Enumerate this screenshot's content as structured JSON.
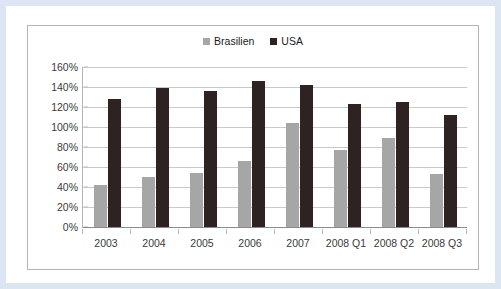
{
  "chart_data": {
    "type": "bar",
    "title": "",
    "xlabel": "",
    "ylabel": "",
    "categories": [
      "2003",
      "2004",
      "2005",
      "2006",
      "2007",
      "2008 Q1",
      "2008 Q2",
      "2008 Q3"
    ],
    "series": [
      {
        "name": "Brasilien",
        "color": "#a6a6a6",
        "values": [
          42,
          50,
          54,
          66,
          104,
          77,
          89,
          53
        ]
      },
      {
        "name": "USA",
        "color": "#2e2222",
        "values": [
          128,
          139,
          136,
          146,
          142,
          123,
          125,
          112
        ]
      }
    ],
    "ylim": [
      0,
      160
    ],
    "ytick_step": 20,
    "ytick_labels": [
      "0%",
      "20%",
      "40%",
      "60%",
      "80%",
      "100%",
      "120%",
      "140%",
      "160%"
    ],
    "value_unit": "%",
    "grid": true,
    "legend_position": "top-center"
  },
  "legend": {
    "entries": [
      {
        "label": "Brasilien",
        "color": "#a6a6a6"
      },
      {
        "label": "USA",
        "color": "#2e2222"
      }
    ]
  },
  "colors": {
    "outer_frame": "#dce6f2",
    "chart_border": "#b5b5b5",
    "gridline": "#c9c9c9",
    "axis": "#8c8c8c",
    "text": "#3a3a3a"
  }
}
